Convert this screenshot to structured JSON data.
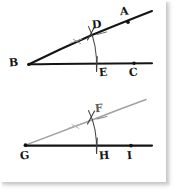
{
  "figure": {
    "background_color": "#ffffff",
    "ink_color": "#141414",
    "faint_ink_color": "#9a9a9a",
    "arc_color": "#3a3a3a"
  },
  "upper_figure": {
    "name": "original-angle-ABC",
    "vertex_label": "B",
    "ray_upper_label": "A",
    "ray_lower_label": "C",
    "arc_top_label": "D",
    "arc_bottom_label": "E",
    "labels": [
      {
        "id": "A",
        "text": "A",
        "x": 121,
        "y": 7
      },
      {
        "id": "D",
        "text": "D",
        "x": 92,
        "y": 20
      },
      {
        "id": "B",
        "text": "B",
        "x": 9,
        "y": 57
      },
      {
        "id": "E",
        "text": "E",
        "x": 99,
        "y": 67
      },
      {
        "id": "C",
        "text": "C",
        "x": 129,
        "y": 67
      }
    ],
    "vertex_point": {
      "x": 28,
      "y": 64
    },
    "points": [
      {
        "id": "A-point",
        "x": 128,
        "y": 22
      },
      {
        "id": "C-point",
        "x": 134,
        "y": 63
      }
    ]
  },
  "lower_figure": {
    "name": "copied-angle-GHI",
    "vertex_label": "G",
    "arc_top_label": "F",
    "base_mid_label": "H",
    "base_end_label": "I",
    "labels": [
      {
        "id": "F",
        "text": "F",
        "x": 95,
        "y": 104
      },
      {
        "id": "G",
        "text": "G",
        "x": 20,
        "y": 150
      },
      {
        "id": "H",
        "text": "H",
        "x": 99,
        "y": 150
      },
      {
        "id": "I",
        "text": "I",
        "x": 127,
        "y": 150
      }
    ],
    "vertex_point": {
      "x": 25,
      "y": 145
    },
    "points": [
      {
        "id": "I-point",
        "x": 131,
        "y": 146
      }
    ]
  }
}
